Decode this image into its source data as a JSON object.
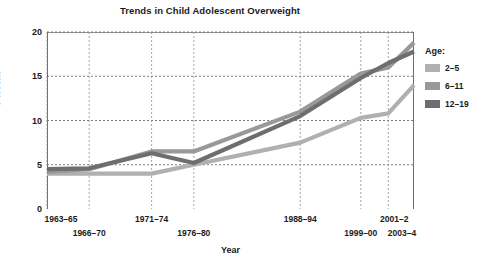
{
  "chart_data": {
    "type": "line",
    "title": "Trends in Child Adolescent Overweight",
    "xlabel": "Year",
    "ylabel": "Percent",
    "categories": [
      "1963–65",
      "1966–70",
      "1971–74",
      "1976–80",
      "1988–94",
      "1999–00",
      "2001–2",
      "2003–4"
    ],
    "series": [
      {
        "name": "2–5",
        "color": "#b0b0b0",
        "values": [
          4.0,
          4.0,
          4.0,
          5.0,
          7.5,
          10.3,
          10.8,
          14.0
        ]
      },
      {
        "name": "6–11",
        "color": "#999999",
        "values": [
          4.2,
          4.5,
          6.5,
          6.5,
          11.0,
          15.3,
          16.0,
          18.8
        ]
      },
      {
        "name": "12–19",
        "color": "#6e6e6e",
        "values": [
          4.5,
          4.6,
          6.3,
          5.2,
          10.5,
          14.8,
          16.5,
          17.8
        ]
      }
    ],
    "yticks": [
      0,
      5,
      10,
      15,
      20
    ],
    "ylim": [
      0,
      20
    ],
    "grid": true,
    "grid_style": "dotted",
    "legend_title": "Age:",
    "legend_position": "right"
  }
}
